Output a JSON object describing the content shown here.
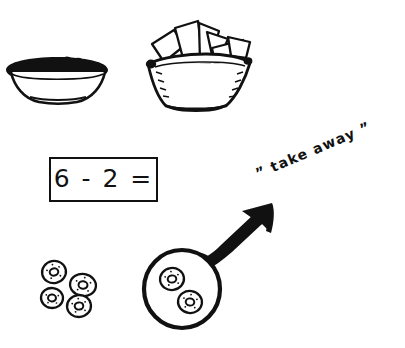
{
  "page": {
    "background_color": "#ffffff",
    "ink_color": "#111111",
    "width": 405,
    "height": 348,
    "style": "hand-drawn black ink line art on white"
  },
  "equation": {
    "text": "6 - 2 =",
    "minuend": "6",
    "operator": "-",
    "subtrahend": "2",
    "equals": "=",
    "answer_shown": false,
    "box_border_color": "#111111"
  },
  "annotation": {
    "text": "” take away ”",
    "plain_text": "take away",
    "open_quote": "”",
    "close_quote": "”",
    "rotation_degrees": -23
  },
  "objects": {
    "bowl": {
      "name": "bowl-of-cereal",
      "label": "bowl filled with round pieces",
      "contents_count": 8
    },
    "basket": {
      "name": "basket-of-breadsticks",
      "label": "basket with crackers fanned out",
      "stick_count": 6
    },
    "loose_donuts": {
      "name": "loose-donuts-group",
      "label": "four remaining donuts",
      "count": 4,
      "positions": [
        {
          "cx": 54,
          "cy": 272,
          "rx": 12,
          "ry": 11,
          "rot": -12
        },
        {
          "cx": 83,
          "cy": 285,
          "rx": 13,
          "ry": 11,
          "rot": 10
        },
        {
          "cx": 52,
          "cy": 298,
          "rx": 11,
          "ry": 10,
          "rot": 6
        },
        {
          "cx": 79,
          "cy": 306,
          "rx": 12,
          "ry": 11,
          "rot": -6
        }
      ]
    },
    "circled_group": {
      "name": "circled-donuts-group",
      "label": "two donuts circled and taken away",
      "count": 2,
      "circle": {
        "cx": 182,
        "cy": 289,
        "rx": 38,
        "ry": 39
      },
      "positions": [
        {
          "cx": 172,
          "cy": 279,
          "rx": 12,
          "ry": 11,
          "rot": -8
        },
        {
          "cx": 190,
          "cy": 302,
          "rx": 12,
          "ry": 11,
          "rot": 8
        }
      ]
    },
    "arrow": {
      "name": "take-away-arrow",
      "label": "thick arrow pointing up-right away from the group",
      "direction": "up-right",
      "from": {
        "x": 205,
        "y": 268
      },
      "to": {
        "x": 268,
        "y": 205
      }
    }
  }
}
